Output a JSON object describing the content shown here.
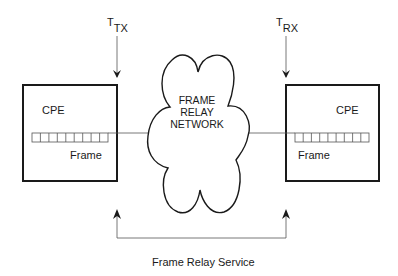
{
  "diagram": {
    "title": "",
    "nodes": {
      "left_cpe": {
        "label": "CPE",
        "frame_label": "Frame",
        "cells": 9
      },
      "right_cpe": {
        "label": "CPE",
        "frame_label": "Frame",
        "cells": 9
      },
      "network": {
        "line1": "FRAME",
        "line2": "RELAY",
        "line3": "NETWORK"
      }
    },
    "timing": {
      "tx": {
        "main": "T",
        "sub": "TX"
      },
      "rx": {
        "main": "T",
        "sub": "RX"
      }
    },
    "service_label": "Frame Relay Service",
    "colors": {
      "stroke": "#1a1a1a",
      "thin": "#555555",
      "background": "#ffffff"
    }
  }
}
